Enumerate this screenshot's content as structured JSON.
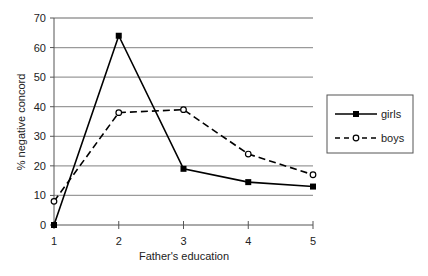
{
  "chart_data": {
    "type": "line",
    "title": "",
    "xlabel": "Father's education",
    "ylabel": "% negative concord",
    "x": [
      1,
      2,
      3,
      4,
      5
    ],
    "categories": [
      "1",
      "2",
      "3",
      "4",
      "5"
    ],
    "ylim": [
      0,
      70
    ],
    "yticks": [
      0,
      10,
      20,
      30,
      40,
      50,
      60,
      70
    ],
    "grid": true,
    "legend_position": "right",
    "series": [
      {
        "name": "girls",
        "values": [
          0,
          64,
          19,
          14.5,
          13
        ],
        "line_style": "solid",
        "marker": "filled-square",
        "color": "#000000"
      },
      {
        "name": "boys",
        "values": [
          8,
          38,
          39,
          24,
          17
        ],
        "line_style": "dashed",
        "marker": "open-circle",
        "color": "#000000"
      }
    ]
  },
  "colors": {
    "gridline": "#9a9a9a",
    "axis": "#555555",
    "series": "#000000"
  }
}
